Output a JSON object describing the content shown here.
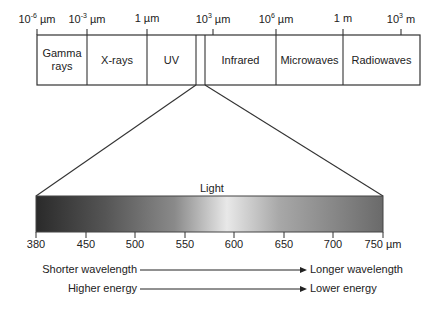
{
  "spectrum": {
    "scale_labels": [
      {
        "base": "10",
        "exp": "-6",
        "unit": " µm",
        "x": 37
      },
      {
        "base": "10",
        "exp": "-3",
        "unit": " µm",
        "x": 87
      },
      {
        "base": "1",
        "exp": "",
        "unit": " µm",
        "x": 147
      },
      {
        "base": "10",
        "exp": "3",
        "unit": " µm",
        "x": 213
      },
      {
        "base": "10",
        "exp": "6",
        "unit": " µm",
        "x": 276
      },
      {
        "base": "1",
        "exp": "",
        "unit": " m",
        "x": 343
      },
      {
        "base": "10",
        "exp": "3",
        "unit": " m",
        "x": 401
      }
    ],
    "bands": [
      {
        "label": "Gamma rays",
        "x0": 37,
        "x1": 87
      },
      {
        "label": "X-rays",
        "x0": 87,
        "x1": 147
      },
      {
        "label": "UV",
        "x0": 147,
        "x1": 196
      },
      {
        "label": "",
        "x0": 196,
        "x1": 205
      },
      {
        "label": "Infrared",
        "x0": 205,
        "x1": 276
      },
      {
        "label": "Microwaves",
        "x0": 276,
        "x1": 343
      },
      {
        "label": "Radiowaves",
        "x0": 343,
        "x1": 420
      }
    ]
  },
  "visible": {
    "title": "Light",
    "ticks": [
      "380",
      "450",
      "500",
      "550",
      "600",
      "650",
      "700",
      "750"
    ],
    "unit": "µm"
  },
  "arrows": [
    {
      "from": "Shorter wavelength",
      "to": "Longer wavelength"
    },
    {
      "from": "Higher energy",
      "to": "Lower energy"
    }
  ]
}
